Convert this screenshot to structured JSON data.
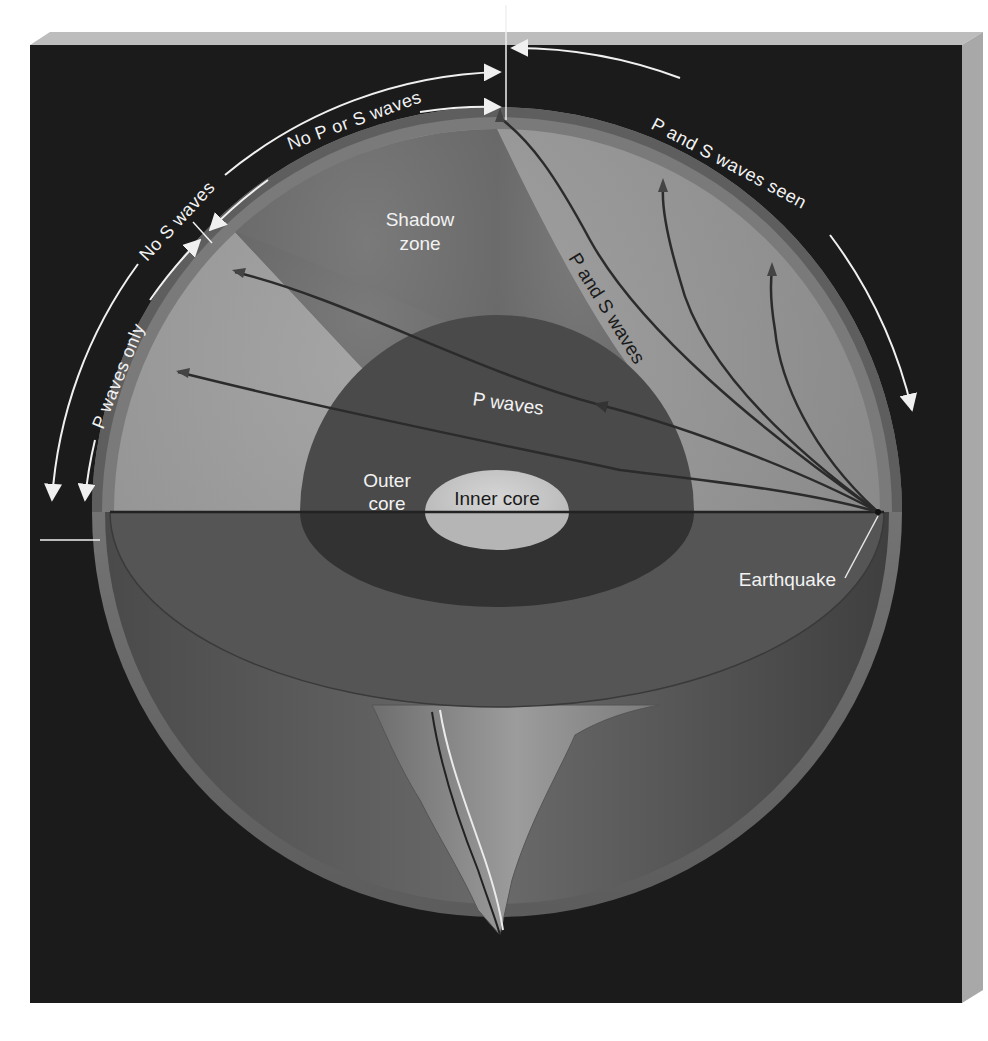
{
  "figure": {
    "colors": {
      "background_panel": "#1b1b1b",
      "panel_bevel_top": "#bdbdbd",
      "panel_bevel_side": "#a8a8a8",
      "mantle_lit": "#9a9a9a",
      "mantle_shadow": "#6f6f6f",
      "crust": "#7c7c7c",
      "outer_core": "#4a4a4a",
      "inner_core": "#c9c9c9",
      "wave_path": "#2a2a2a",
      "annotation": "#f0f0f0"
    }
  },
  "arc_labels": {
    "p_waves_only": "P waves only",
    "no_s_waves": "No S waves",
    "no_p_or_s_waves": "No P or S waves",
    "p_and_s_waves_seen": "P and S waves seen"
  },
  "region_labels": {
    "shadow_zone_line1": "Shadow",
    "shadow_zone_line2": "zone",
    "outer_core_line1": "Outer",
    "outer_core_line2": "core",
    "inner_core": "Inner core",
    "earthquake": "Earthquake"
  },
  "path_labels": {
    "p_waves": "P waves",
    "p_and_s_waves": "P and S waves"
  }
}
